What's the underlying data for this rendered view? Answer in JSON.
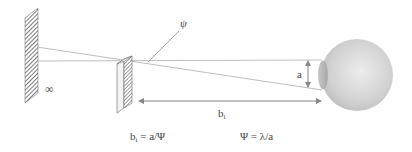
{
  "diagram": {
    "labels": {
      "infinity": "∞",
      "psi_angle": "ψ",
      "aperture": "a",
      "distance_main": "b",
      "distance_sub": "i"
    },
    "formulas": {
      "left_main": "b",
      "left_sub": "i",
      "left_rest": " = a/Ψ",
      "right": "Ψ = λ/a"
    },
    "elements": {
      "far_screen": "hatched-screen-at-infinity",
      "object": "hatched-grating",
      "eye": "eyeball-with-pupil"
    },
    "colors": {
      "lines": "#b0b0b0",
      "arrows": "#888888",
      "hatch": "#555555",
      "eye": "#d6d6d6",
      "pupil": "#bdbdbd"
    }
  }
}
